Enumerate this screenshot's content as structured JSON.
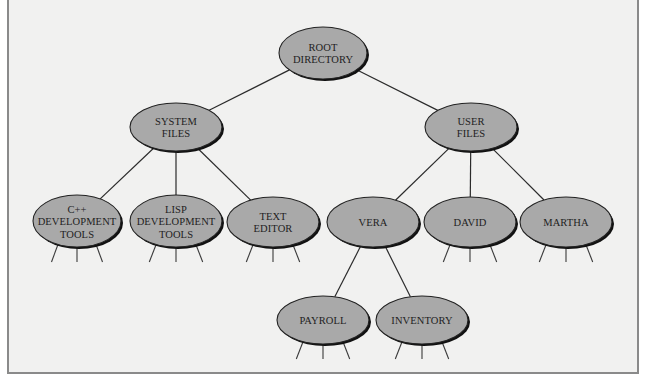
{
  "diagram": {
    "colors": {
      "background": "#f1f1f0",
      "node_fill": "#a9a9a9",
      "node_outline": "#222222",
      "edge": "#2b2b2b",
      "frame_border": "#8a8a8a"
    },
    "nodes": [
      {
        "id": "root",
        "lines": [
          "ROOT",
          "DIRECTORY"
        ],
        "cx": 323,
        "cy": 53,
        "rx": 44,
        "ry": 26,
        "stubs": false
      },
      {
        "id": "system-files",
        "lines": [
          "SYSTEM",
          "FILES"
        ],
        "cx": 176,
        "cy": 127,
        "rx": 46,
        "ry": 24,
        "stubs": false
      },
      {
        "id": "user-files",
        "lines": [
          "USER",
          "FILES"
        ],
        "cx": 471,
        "cy": 127,
        "rx": 46,
        "ry": 24,
        "stubs": false
      },
      {
        "id": "cpp-dev-tools",
        "lines": [
          "C++",
          "DEVELOPMENT",
          "TOOLS"
        ],
        "cx": 77,
        "cy": 221,
        "rx": 44,
        "ry": 26,
        "stubs": true
      },
      {
        "id": "lisp-dev-tools",
        "lines": [
          "LISP",
          "DEVELOPMENT",
          "TOOLS"
        ],
        "cx": 176,
        "cy": 221,
        "rx": 46,
        "ry": 26,
        "stubs": true
      },
      {
        "id": "text-editor",
        "lines": [
          "TEXT",
          "EDITOR"
        ],
        "cx": 273,
        "cy": 222,
        "rx": 46,
        "ry": 25,
        "stubs": true
      },
      {
        "id": "vera",
        "lines": [
          "VERA"
        ],
        "cx": 373,
        "cy": 222,
        "rx": 46,
        "ry": 25,
        "stubs": false
      },
      {
        "id": "david",
        "lines": [
          "DAVID"
        ],
        "cx": 470,
        "cy": 222,
        "rx": 46,
        "ry": 25,
        "stubs": true
      },
      {
        "id": "martha",
        "lines": [
          "MARTHA"
        ],
        "cx": 566,
        "cy": 222,
        "rx": 46,
        "ry": 25,
        "stubs": true
      },
      {
        "id": "payroll",
        "lines": [
          "PAYROLL"
        ],
        "cx": 323,
        "cy": 320,
        "rx": 46,
        "ry": 24,
        "stubs": true
      },
      {
        "id": "inventory",
        "lines": [
          "INVENTORY"
        ],
        "cx": 422,
        "cy": 320,
        "rx": 46,
        "ry": 24,
        "stubs": true
      }
    ],
    "edges": [
      {
        "from": "root",
        "to": "system-files"
      },
      {
        "from": "root",
        "to": "user-files"
      },
      {
        "from": "system-files",
        "to": "cpp-dev-tools"
      },
      {
        "from": "system-files",
        "to": "lisp-dev-tools"
      },
      {
        "from": "system-files",
        "to": "text-editor"
      },
      {
        "from": "user-files",
        "to": "vera"
      },
      {
        "from": "user-files",
        "to": "david"
      },
      {
        "from": "user-files",
        "to": "martha"
      },
      {
        "from": "vera",
        "to": "payroll"
      },
      {
        "from": "vera",
        "to": "inventory"
      }
    ],
    "stub_length": 16
  }
}
